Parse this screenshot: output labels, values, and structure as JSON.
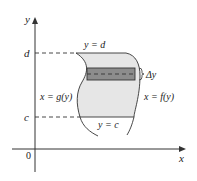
{
  "diagram": {
    "type": "region-between-curves-horizontal-strip",
    "axes": {
      "x_label": "x",
      "y_label": "y",
      "origin_label": "0"
    },
    "levels": {
      "d_label": "d",
      "c_label": "c"
    },
    "boundaries": {
      "top": "y = d",
      "bottom": "y = c",
      "left": "x = g(y)",
      "right": "x = f(y)"
    },
    "strip": {
      "label": "Δy"
    },
    "colors": {
      "region_fill": "#e6e6e6",
      "strip_fill": "#8c8c8c",
      "curve_stroke": "#333333",
      "axis_stroke": "#333333"
    }
  }
}
